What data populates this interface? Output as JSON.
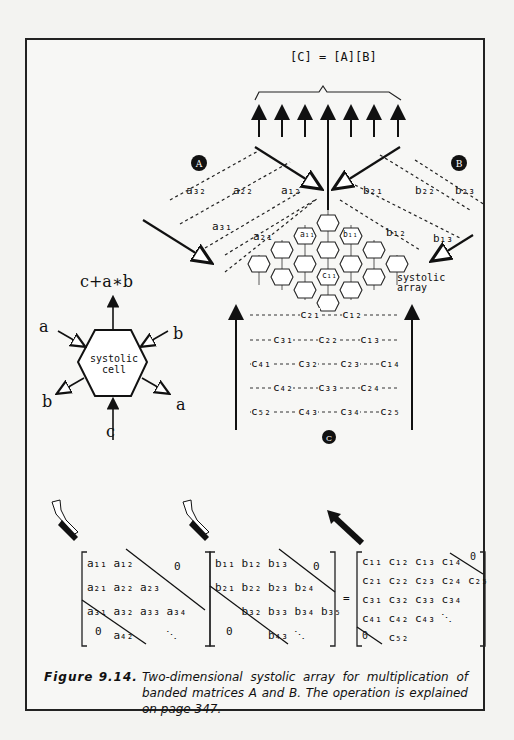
{
  "figure": {
    "equation": "[C] = [A][B]",
    "array_label_line1": "systolic",
    "array_label_line2": "array",
    "cell_label_line1": "systolic",
    "cell_label_line2": "cell",
    "cell_output": "c+a∗b",
    "cell_inputs": {
      "a_in": "a",
      "b_in": "b",
      "b_out": "b",
      "a_out": "a",
      "c_in": "c"
    },
    "markers": [
      "A",
      "B",
      "C"
    ],
    "a_stream": [
      "a32",
      "a22",
      "a12",
      "a31",
      "a21"
    ],
    "b_stream": [
      "b21",
      "b22",
      "b23",
      "b12",
      "b13"
    ],
    "array_cells": [
      "a11",
      "b11",
      "c11"
    ],
    "c_stream_rows": [
      [
        "c21",
        "c12"
      ],
      [
        "c31",
        "c22",
        "c13"
      ],
      [
        "c41",
        "c32",
        "c23",
        "c14"
      ],
      [
        "c42",
        "c33",
        "c24"
      ],
      [
        "c52",
        "c43",
        "c34",
        "c25"
      ]
    ],
    "matrix_A": {
      "rows": [
        [
          "a11",
          "a12"
        ],
        [
          "a21",
          "a22",
          "a23"
        ],
        [
          "a31",
          "a32",
          "a33",
          "a34"
        ],
        [
          "a42"
        ]
      ],
      "zero_upper": "0",
      "zero_lower": "0",
      "dots": "⋱"
    },
    "matrix_B": {
      "rows": [
        [
          "b11",
          "b12",
          "b13"
        ],
        [
          "b21",
          "b22",
          "b23",
          "b24"
        ],
        [
          "b32",
          "b33",
          "b34",
          "b35"
        ],
        [
          "b43"
        ]
      ],
      "zero_upper": "0",
      "zero_lower": "0",
      "dots": "⋱"
    },
    "matrix_C": {
      "rows": [
        [
          "c11",
          "c12",
          "c13",
          "c14"
        ],
        [
          "c21",
          "c22",
          "c23",
          "c24",
          "c25"
        ],
        [
          "c31",
          "c32",
          "c33",
          "c34"
        ],
        [
          "c41",
          "c42",
          "c43"
        ],
        [
          "c52"
        ]
      ],
      "zero_upper": "0",
      "zero_lower": "0",
      "dots": "⋱"
    },
    "equals": "="
  },
  "caption": {
    "label": "Figure 9.14.",
    "text": "Two-dimensional systolic array for multiplication of banded matrices A and B.  The operation is explained on page 347."
  }
}
